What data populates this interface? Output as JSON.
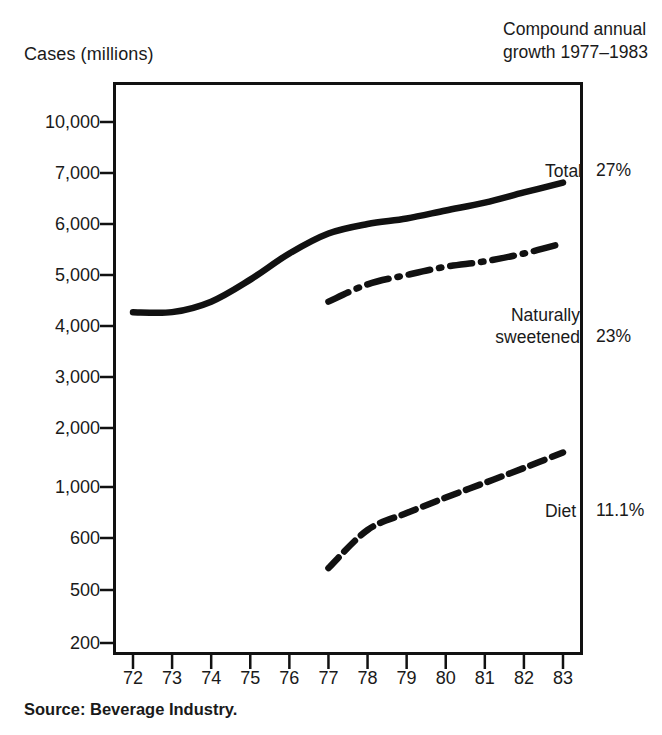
{
  "axis_title": "Cases (millions)",
  "corner_note": {
    "line1": "Compound annual",
    "line2": "growth 1977–1983"
  },
  "source": "Source: Beverage Industry.",
  "series_labels": {
    "total": "Total",
    "natural_line1": "Naturally",
    "natural_line2": "sweetened",
    "diet": "Diet"
  },
  "growth": {
    "total": "27%",
    "natural": "23%",
    "diet": "11.1%"
  },
  "chart_data": {
    "type": "line",
    "title": "",
    "subtitle": "",
    "xlabel": "",
    "ylabel": "Cases (millions)",
    "grid": false,
    "legend_position": "right-inline",
    "x": [
      72,
      73,
      74,
      75,
      76,
      77,
      78,
      79,
      80,
      81,
      82,
      83
    ],
    "xtick_labels": [
      "72",
      "73",
      "74",
      "75",
      "76",
      "77",
      "78",
      "79",
      "80",
      "81",
      "82",
      "83"
    ],
    "ytick_labels": [
      "10,000",
      "7,000",
      "6,000",
      "5,000",
      "4,000",
      "3,000",
      "2,000",
      "1,000",
      "600",
      "500",
      "200"
    ],
    "ytick_values": [
      10000,
      7000,
      6000,
      5000,
      4000,
      3000,
      2000,
      1000,
      600,
      500,
      200
    ],
    "yaxis_scale": "ordinal-log (ticks evenly spaced)",
    "series": [
      {
        "name": "Total",
        "style": "solid",
        "growth_1977_1983": "27%",
        "x": [
          72,
          73,
          74,
          75,
          76,
          77,
          78,
          79,
          80,
          81,
          82,
          83
        ],
        "values": [
          4250,
          4250,
          4450,
          4900,
          5400,
          5800,
          6000,
          6100,
          6250,
          6400,
          6600,
          6800
        ]
      },
      {
        "name": "Naturally sweetened",
        "style": "dash-dot",
        "growth_1977_1983": "23%",
        "x": [
          77,
          78,
          79,
          80,
          81,
          82,
          83
        ],
        "values": [
          4450,
          4800,
          5000,
          5150,
          5250,
          5400,
          5600
        ]
      },
      {
        "name": "Diet",
        "style": "dashed",
        "growth_1977_1983": "11.1%",
        "x": [
          77,
          78,
          79,
          80,
          81,
          82,
          83
        ],
        "values": [
          540,
          650,
          770,
          900,
          1050,
          1250,
          1500
        ]
      }
    ]
  },
  "colors": {
    "ink": "#111111",
    "background": "#ffffff"
  }
}
